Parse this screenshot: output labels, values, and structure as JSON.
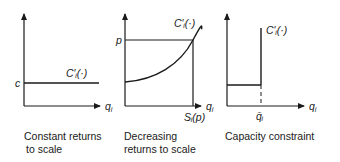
{
  "panels": [
    {
      "id": "constant",
      "caption_line1": "Constant returns",
      "caption_line2": "to scale",
      "y_label": "c",
      "curve_label": "C′ᵢ(·)",
      "x_axis_label": "q",
      "x_axis_sub": "i"
    },
    {
      "id": "decreasing",
      "caption_line1": "Decreasing",
      "caption_line2": "returns to scale",
      "y_label": "p",
      "curve_label": "C′ᵢ(·)",
      "x_axis_label": "q",
      "x_axis_sub": "i",
      "x_tick_label": "Sᵢ(p)"
    },
    {
      "id": "capacity",
      "caption_line1": "Capacity constraint",
      "curve_label": "C′ᵢ(·)",
      "x_axis_label": "q",
      "x_axis_sub": "i",
      "x_tick_label": "q̄ᵢ"
    }
  ],
  "colors": {
    "ink": "#1a1a1a",
    "background": "#ffffff"
  }
}
